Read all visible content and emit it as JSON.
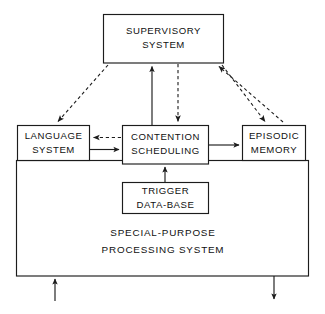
{
  "diagram": {
    "colors": {
      "stroke": "#1c1c1c",
      "fill": "#ffffff",
      "text": "#101010",
      "background": "#ffffff"
    },
    "boxes": {
      "supervisory": {
        "line1": "SUPERVISORY",
        "line2": "SYSTEM"
      },
      "language": {
        "line1": "LANGUAGE",
        "line2": "SYSTEM"
      },
      "contention": {
        "line1": "CONTENTION",
        "line2": "SCHEDULING"
      },
      "episodic": {
        "line1": "EPISODIC",
        "line2": "MEMORY"
      },
      "trigger": {
        "line1": "TRIGGER",
        "line2": "DATA-BASE"
      },
      "special_purpose": {
        "line1": "SPECIAL-PURPOSE",
        "line2": "PROCESSING  SYSTEM"
      }
    },
    "connections": [
      {
        "name": "supervisory-to-language",
        "style": "dashed",
        "direction": "down-left"
      },
      {
        "name": "contention-to-supervisory",
        "style": "solid",
        "direction": "up"
      },
      {
        "name": "supervisory-to-contention",
        "style": "dashed",
        "direction": "down"
      },
      {
        "name": "episodic-to-supervisory",
        "style": "dashed",
        "direction": "up-left"
      },
      {
        "name": "supervisory-to-episodic",
        "style": "dashed",
        "direction": "down-right"
      },
      {
        "name": "contention-to-language",
        "style": "dashed",
        "direction": "left"
      },
      {
        "name": "language-to-contention",
        "style": "solid",
        "direction": "right"
      },
      {
        "name": "contention-to-episodic",
        "style": "solid",
        "direction": "right"
      },
      {
        "name": "trigger-to-contention",
        "style": "solid",
        "direction": "up"
      },
      {
        "name": "external-input",
        "style": "solid",
        "direction": "up"
      },
      {
        "name": "external-output",
        "style": "solid",
        "direction": "down"
      }
    ]
  }
}
